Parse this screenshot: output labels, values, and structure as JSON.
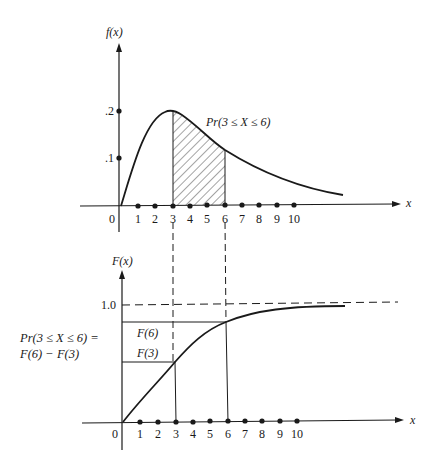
{
  "figure": {
    "top_panel": {
      "y_axis_label": "f(x)",
      "x_axis_label": "x",
      "origin_label": "0",
      "y_ticks": [
        ".2",
        ".1"
      ],
      "x_ticks": [
        "1",
        "2",
        "3",
        "4",
        "5",
        "6",
        "7",
        "8",
        "9",
        "10"
      ],
      "shaded_region_label": "Pr(3 ≤ X ≤ 6)"
    },
    "bottom_panel": {
      "y_axis_label": "F(x)",
      "x_axis_label": "x",
      "origin_label": "0",
      "y_tick": "1.0",
      "x_ticks": [
        "1",
        "2",
        "3",
        "4",
        "5",
        "6",
        "7",
        "8",
        "9",
        "10"
      ],
      "f6_label": "F(6)",
      "f3_label": "F(3)",
      "annotation_line1": "Pr(3 ≤ X ≤ 6) =",
      "annotation_line2": "F(6) − F(3)"
    },
    "colors": {
      "ink": "#1a1a1a",
      "background": "#ffffff"
    }
  }
}
